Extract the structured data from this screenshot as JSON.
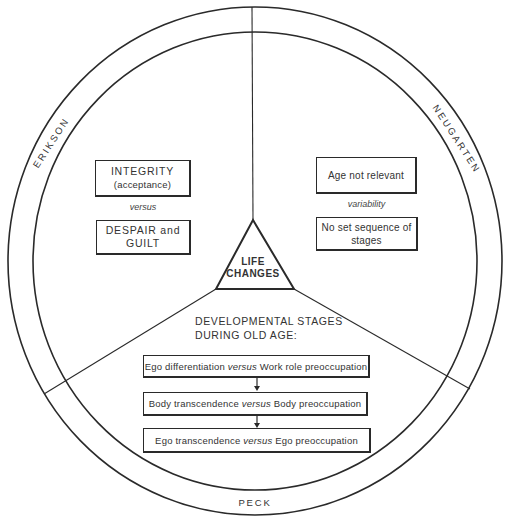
{
  "center": {
    "line1": "LIFE",
    "line2": "CHANGES"
  },
  "sections": {
    "erikson": {
      "label": "ERIKSON",
      "box_top": {
        "line1": "INTEGRITY",
        "line2": "(acceptance)"
      },
      "connector": "versus",
      "box_bottom": {
        "line1": "DESPAIR and",
        "line2": "GUILT"
      }
    },
    "neugarten": {
      "label": "NEUGARTEN",
      "box_top": {
        "line1": "Age not relevant"
      },
      "connector": "variability",
      "box_bottom": {
        "line1": "No set sequence of",
        "line2": "stages"
      }
    },
    "peck": {
      "label": "PECK",
      "heading": {
        "line1": "DEVELOPMENTAL STAGES",
        "line2": "DURING OLD AGE:"
      },
      "stages": [
        {
          "left": "Ego differentiation",
          "connector": "versus",
          "right": "Work role preoccupation"
        },
        {
          "left": "Body transcendence",
          "connector": "versus",
          "right": "Body preoccupation"
        },
        {
          "left": "Ego transcendence",
          "connector": "versus",
          "right": "Ego preoccupation"
        }
      ]
    }
  },
  "colors": {
    "line": "#2a2a2a",
    "background": "#ffffff",
    "text": "#333333"
  }
}
